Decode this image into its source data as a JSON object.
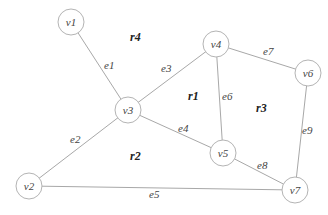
{
  "graph": {
    "nodes": [
      {
        "id": "v1",
        "label": "v1",
        "x": 71,
        "y": 22
      },
      {
        "id": "v2",
        "label": "v2",
        "x": 29,
        "y": 186
      },
      {
        "id": "v3",
        "label": "v3",
        "x": 128,
        "y": 110
      },
      {
        "id": "v4",
        "label": "v4",
        "x": 216,
        "y": 44
      },
      {
        "id": "v5",
        "label": "v5",
        "x": 223,
        "y": 153
      },
      {
        "id": "v6",
        "label": "v6",
        "x": 308,
        "y": 73
      },
      {
        "id": "v7",
        "label": "v7",
        "x": 295,
        "y": 190
      }
    ],
    "edges": [
      {
        "id": "e1",
        "label": "e1",
        "from": "v1",
        "to": "v3"
      },
      {
        "id": "e2",
        "label": "e2",
        "from": "v2",
        "to": "v3"
      },
      {
        "id": "e3",
        "label": "e3",
        "from": "v3",
        "to": "v4"
      },
      {
        "id": "e4",
        "label": "e4",
        "from": "v3",
        "to": "v5"
      },
      {
        "id": "e5",
        "label": "e5",
        "from": "v2",
        "to": "v7"
      },
      {
        "id": "e6",
        "label": "e6",
        "from": "v4",
        "to": "v5"
      },
      {
        "id": "e7",
        "label": "e7",
        "from": "v4",
        "to": "v6"
      },
      {
        "id": "e8",
        "label": "e8",
        "from": "v5",
        "to": "v7"
      },
      {
        "id": "e9",
        "label": "e9",
        "from": "v6",
        "to": "v7"
      }
    ],
    "regions": [
      {
        "id": "r1",
        "label": "r1"
      },
      {
        "id": "r2",
        "label": "r2"
      },
      {
        "id": "r3",
        "label": "r3"
      },
      {
        "id": "r4",
        "label": "r4"
      }
    ]
  }
}
